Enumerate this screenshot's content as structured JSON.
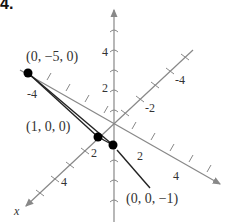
{
  "problem_number": "4.",
  "axes": {
    "x_label": "x",
    "x_ticks_positive": [
      "2",
      "4"
    ],
    "x_ticks_negative": [
      "-2",
      "-4"
    ],
    "y_ticks_positive": [
      "2",
      "4"
    ],
    "y_ticks_negative": [
      "-4"
    ],
    "z_ticks_positive": [
      "2",
      "4"
    ]
  },
  "points": [
    {
      "label": "(0, −5, 0)",
      "coords": [
        0,
        -5,
        0
      ]
    },
    {
      "label": "(1, 0, 0)",
      "coords": [
        1,
        0,
        0
      ]
    },
    {
      "label": "(0, 0, −1)",
      "coords": [
        0,
        0,
        -1
      ]
    }
  ],
  "colors": {
    "axis": "#888888",
    "segment": "#222222",
    "point": "#000000"
  }
}
